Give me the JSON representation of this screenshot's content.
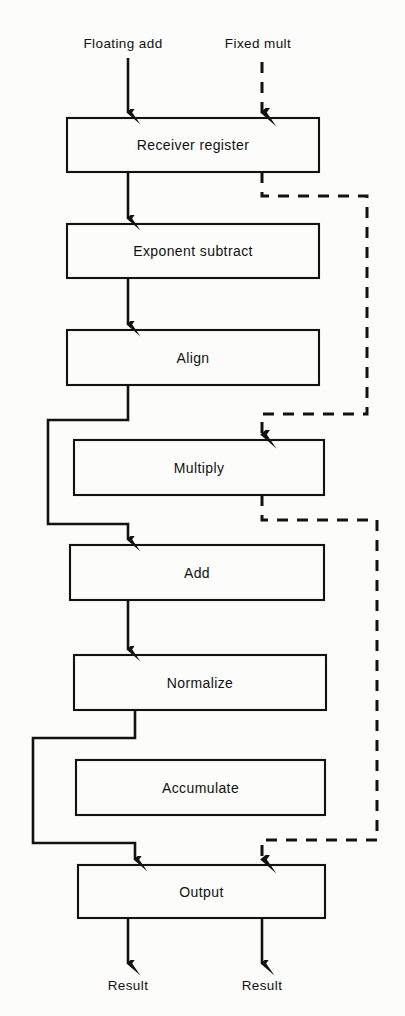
{
  "diagram": {
    "stroke_color": "#121212",
    "background": "#fcfcfa",
    "inputs": [
      {
        "label": "Floating add",
        "style": "solid",
        "x": 123,
        "y": 45
      },
      {
        "label": "Fixed mult",
        "style": "dashed",
        "x": 258,
        "y": 45
      }
    ],
    "stages": [
      {
        "id": "receiver",
        "label": "Receiver register",
        "x": 67,
        "y": 118,
        "w": 252,
        "h": 54
      },
      {
        "id": "exponent",
        "label": "Exponent subtract",
        "x": 67,
        "y": 224,
        "w": 252,
        "h": 54
      },
      {
        "id": "align",
        "label": "Align",
        "x": 67,
        "y": 330,
        "w": 252,
        "h": 55
      },
      {
        "id": "multiply",
        "label": "Multiply",
        "x": 74,
        "y": 440,
        "w": 250,
        "h": 55
      },
      {
        "id": "add",
        "label": "Add",
        "x": 70,
        "y": 545,
        "w": 254,
        "h": 55
      },
      {
        "id": "normalize",
        "label": "Normalize",
        "x": 74,
        "y": 655,
        "w": 252,
        "h": 55
      },
      {
        "id": "accumulate",
        "label": "Accumulate",
        "x": 76,
        "y": 760,
        "w": 249,
        "h": 55
      },
      {
        "id": "output",
        "label": "Output",
        "x": 78,
        "y": 865,
        "w": 247,
        "h": 53
      }
    ],
    "outputs": [
      {
        "label": "Result",
        "style": "solid",
        "x": 128,
        "y": 985
      },
      {
        "label": "Result",
        "style": "solid",
        "x": 262,
        "y": 985
      }
    ],
    "legend": {
      "solid_path": "Floating add pipeline",
      "dashed_path": "Fixed multiply pipeline"
    }
  }
}
